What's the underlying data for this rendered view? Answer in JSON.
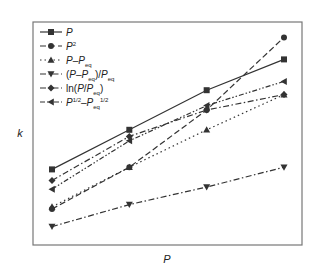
{
  "chart_data": {
    "type": "line",
    "title": "",
    "xlabel": "P",
    "ylabel": "k",
    "x": [
      1,
      2,
      3,
      4
    ],
    "xlim": [
      0.9,
      4.15
    ],
    "ylim": [
      0,
      100
    ],
    "grid": false,
    "ticks_shown": false,
    "legend_position": "top-left",
    "series": [
      {
        "name": "P",
        "label_parts": [
          [
            "P",
            "i"
          ]
        ],
        "marker": "square",
        "dash": "solid",
        "color": "#333333",
        "values": [
          33,
          51,
          69,
          83
        ]
      },
      {
        "name": "P^2",
        "label_parts": [
          [
            "P",
            "i"
          ],
          [
            "2",
            "sup"
          ]
        ],
        "marker": "circle",
        "dash": "dashed",
        "color": "#333333",
        "values": [
          15,
          34,
          60,
          93
        ]
      },
      {
        "name": "P-Peq",
        "label_parts": [
          [
            "P",
            "i"
          ],
          [
            "–",
            ""
          ],
          [
            "P",
            "i"
          ],
          [
            "eq",
            "sub"
          ]
        ],
        "marker": "triangle-up",
        "dash": "dotted",
        "color": "#333333",
        "values": [
          16,
          34,
          51,
          67
        ]
      },
      {
        "name": "(P-Peq)/Peq",
        "label_parts": [
          [
            "(",
            ""
          ],
          [
            "P",
            "i"
          ],
          [
            "–",
            ""
          ],
          [
            "P",
            "i"
          ],
          [
            "eq",
            "sub"
          ],
          [
            ")/",
            ""
          ],
          [
            "P",
            "i"
          ],
          [
            "eq",
            "sub"
          ]
        ],
        "marker": "triangle-down",
        "dash": "dash-dot",
        "color": "#333333",
        "values": [
          7,
          17,
          25,
          34
        ]
      },
      {
        "name": "ln(P/Peq)",
        "label_parts": [
          [
            "ln(",
            ""
          ],
          [
            "P",
            "i"
          ],
          [
            "/",
            ""
          ],
          [
            "P",
            "i"
          ],
          [
            "eq",
            "sub"
          ],
          [
            ")",
            ""
          ]
        ],
        "marker": "diamond",
        "dash": "dash-dot",
        "color": "#333333",
        "values": [
          28,
          48,
          60,
          67
        ]
      },
      {
        "name": "P^1/2-Peq^1/2",
        "label_parts": [
          [
            "P",
            "i"
          ],
          [
            "1/2",
            "sup"
          ],
          [
            "–",
            ""
          ],
          [
            "P",
            "i"
          ],
          [
            "eq",
            "sub"
          ],
          [
            "1/2",
            "sup"
          ]
        ],
        "marker": "triangle-left",
        "dash": "dash-dot-dot",
        "color": "#333333",
        "values": [
          24,
          46,
          62,
          73
        ]
      }
    ]
  }
}
